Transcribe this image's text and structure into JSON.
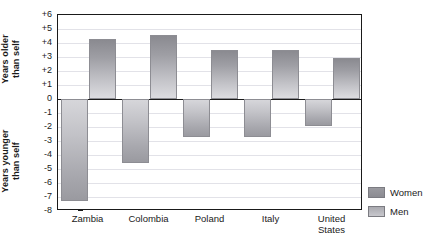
{
  "chart_data": {
    "type": "bar",
    "title": "",
    "subtitle": "",
    "xlabel": "",
    "ylabel_upper": "Years older than self",
    "ylabel_lower": "Years younger than self",
    "categories": [
      "Zambia",
      "Colombia",
      "Poland",
      "Italy",
      "United States"
    ],
    "series": [
      {
        "name": "Women",
        "values": [
          -7.3,
          -4.6,
          -2.7,
          -2.7,
          -1.9
        ]
      },
      {
        "name": "Men",
        "values": [
          4.3,
          4.6,
          3.5,
          3.5,
          2.9
        ]
      }
    ],
    "ylim": [
      -8,
      6
    ],
    "ytick_values": [
      6,
      5,
      4,
      3,
      2,
      1,
      0,
      -1,
      -2,
      -3,
      -4,
      -5,
      -6,
      -7,
      -8
    ],
    "ytick_labels": [
      "+6",
      "+5",
      "+4",
      "+3",
      "+2",
      "+1",
      "0",
      "-1",
      "-2",
      "-3",
      "-4",
      "-5",
      "-6",
      "-7",
      "-8"
    ],
    "grid": true,
    "legend_position": "right-bottom",
    "colors": {
      "women": "#9a9aa0",
      "men": "#b4b4ba",
      "axis": "#1a1a1a",
      "grid": "#e2e2e8",
      "background": "#ffffff"
    }
  },
  "axis_titles": {
    "upper_line1": "Years older",
    "upper_line2": "than self",
    "lower_line1": "Years younger",
    "lower_line2": "than self"
  },
  "legend": {
    "items": [
      {
        "label": "Women",
        "swatch": "women"
      },
      {
        "label": "Men",
        "swatch": "men"
      }
    ]
  }
}
